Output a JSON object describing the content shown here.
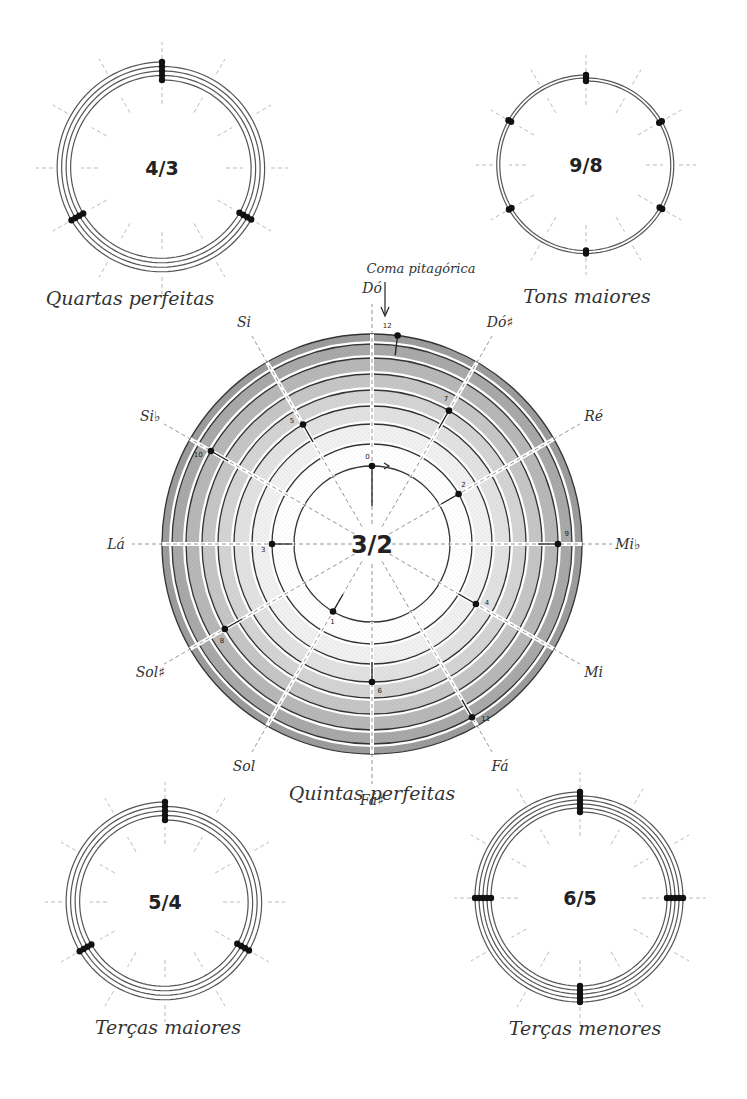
{
  "main": {
    "title": "Quintas perfeitas",
    "ratio": "3/2",
    "annotation": "Coma pitagórica",
    "center": [
      372,
      544
    ],
    "ring_radii": [
      78,
      100,
      120,
      138,
      154,
      170,
      186,
      200,
      210
    ],
    "ring_shades": [
      "#ffffff",
      "#f1f1f1",
      "#e2e2e2",
      "#d4d4d4",
      "#c6c6c6",
      "#b8b8b8",
      "#a9a9a9",
      "#9c9c9c"
    ],
    "notes": [
      {
        "label": "Dó",
        "angle": 0
      },
      {
        "label": "Dó♯",
        "angle": 30
      },
      {
        "label": "Ré",
        "angle": 60
      },
      {
        "label": "Mi♭",
        "angle": 90
      },
      {
        "label": "Mi",
        "angle": 120
      },
      {
        "label": "Fá",
        "angle": 150
      },
      {
        "label": "Fá♯",
        "angle": 180
      },
      {
        "label": "Sol",
        "angle": 210
      },
      {
        "label": "Sol♯",
        "angle": 240
      },
      {
        "label": "Lá",
        "angle": 270
      },
      {
        "label": "Si♭",
        "angle": 300
      },
      {
        "label": "Si",
        "angle": 330
      }
    ],
    "points": [
      {
        "n": "0",
        "angle": 0,
        "r": 78
      },
      {
        "n": "1",
        "angle": 210,
        "r": 78
      },
      {
        "n": "2",
        "angle": 60,
        "r": 100
      },
      {
        "n": "3",
        "angle": 270,
        "r": 100
      },
      {
        "n": "4",
        "angle": 120,
        "r": 120
      },
      {
        "n": "5",
        "angle": 330,
        "r": 138
      },
      {
        "n": "6",
        "angle": 180,
        "r": 138
      },
      {
        "n": "7",
        "angle": 30,
        "r": 154
      },
      {
        "n": "8",
        "angle": 240,
        "r": 170
      },
      {
        "n": "9",
        "angle": 90,
        "r": 186
      },
      {
        "n": "10",
        "angle": 300,
        "r": 186
      },
      {
        "n": "11",
        "angle": 150,
        "r": 200
      },
      {
        "n": "12",
        "angle": 7,
        "r": 210
      }
    ]
  },
  "small_diagrams": [
    {
      "id": "fourths",
      "ratio": "4/3",
      "caption": "Quartas perfeitas",
      "center": [
        162,
        168
      ],
      "radii": [
        86,
        92,
        98,
        104
      ],
      "dots": 13
    },
    {
      "id": "major-tones",
      "ratio": "9/8",
      "caption": "Tons maiores",
      "center": [
        586,
        165
      ],
      "radii": [
        82,
        88
      ],
      "dots": 13
    },
    {
      "id": "major-thirds",
      "ratio": "5/4",
      "caption": "Terças maiores",
      "center": [
        165,
        902
      ],
      "radii": [
        80,
        86,
        92,
        98
      ],
      "dots": 13
    },
    {
      "id": "minor-thirds",
      "ratio": "6/5",
      "caption": "Terças menores",
      "center": [
        580,
        898
      ],
      "radii": [
        84,
        89,
        94,
        99,
        104
      ],
      "dots": 21
    }
  ]
}
